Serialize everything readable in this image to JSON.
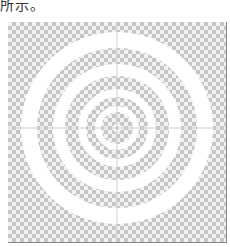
{
  "caption": {
    "text": "所示。"
  },
  "figure": {
    "background": "checkerboard",
    "checker_colors": [
      "#c6c6c6",
      "#f2f2f2"
    ],
    "ring_color": "#ffffff",
    "crosshair_color": "#cfcfcf",
    "center": {
      "x": 109,
      "y": 106
    },
    "rings": [
      {
        "outer_r": 96,
        "inner_r": 80
      },
      {
        "outer_r": 64,
        "inner_r": 52
      },
      {
        "outer_r": 39,
        "inner_r": 31
      },
      {
        "outer_r": 22,
        "inner_r": 16
      },
      {
        "outer_r": 4,
        "inner_r": 2
      }
    ]
  }
}
